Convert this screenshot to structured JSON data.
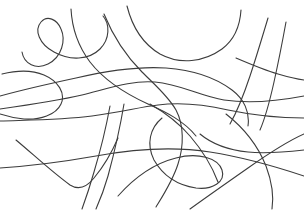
{
  "canvas": {
    "width": 304,
    "height": 210,
    "background_color": "#ffffff",
    "title": "Abstract curve scribble line drawing"
  },
  "style": {
    "stroke_color": "#3c3c3c",
    "stroke_width": 1.1,
    "fill": "none"
  },
  "chart_data": {
    "type": "line",
    "title": "",
    "xlabel": "",
    "ylabel": "",
    "xlim": [
      0,
      304
    ],
    "ylim": [
      0,
      210
    ],
    "grid": false,
    "legend": null,
    "note": "Twelve smooth freeform curves on a white field; dense crossing cluster near (150,105)",
    "series": [
      {
        "name": "curve-1-upper-left-leaf",
        "color": "#3c3c3c",
        "path": "M 22,52 C 24,64 36,70 48,64 C 62,57 66,40 61,29 C 57,19 47,15 41,22 C 34,30 39,44 54,52 C 70,61 89,60 100,49 C 110,39 110,24 103,16"
      },
      {
        "name": "curve-2-left-hook",
        "color": "#3c3c3c",
        "path": "M 2,74 C 14,71 30,69 44,75 C 58,81 66,93 61,104 C 56,115 40,120 24,119 C 14,118 6,116 0,114"
      },
      {
        "name": "curve-3-long-horizontal-upper",
        "color": "#3c3c3c",
        "path": "M 0,109 C 28,105 56,101 82,95 C 110,88 132,80 155,82 C 180,84 200,96 224,100 C 250,104 278,101 304,96"
      },
      {
        "name": "curve-4-horizontal-lower-twin",
        "color": "#3c3c3c",
        "path": "M 0,121 C 30,120 62,120 92,116 C 122,112 140,107 158,105 C 182,102 206,105 228,110 C 252,115 278,118 304,118"
      },
      {
        "name": "curve-5-top-descender-left",
        "color": "#3c3c3c",
        "path": "M 71,9 C 72,28 78,46 90,62 C 104,80 126,94 148,104 C 166,112 184,121 196,136"
      },
      {
        "name": "curve-6-top-arc-center",
        "color": "#3c3c3c",
        "path": "M 104,14 C 113,36 126,56 142,72 C 156,86 168,96 176,110 C 184,125 184,146 178,164 C 173,180 164,194 156,207"
      },
      {
        "name": "curve-7-top-long-sweep",
        "color": "#3c3c3c",
        "path": "M 127,6 C 132,26 143,44 160,54 C 180,65 204,62 222,49 C 234,40 240,26 241,10"
      },
      {
        "name": "curve-8-upper-plateau",
        "color": "#3c3c3c",
        "path": "M 0,96 C 22,90 48,84 76,78 C 106,71 136,66 166,68 C 194,70 216,78 232,90 C 244,99 250,112 248,126"
      },
      {
        "name": "curve-9-right-diagonal-a",
        "color": "#3c3c3c",
        "path": "M 268,18 C 262,38 256,58 250,76 C 244,94 238,110 230,124"
      },
      {
        "name": "curve-10-right-diagonal-b",
        "color": "#3c3c3c",
        "path": "M 286,22 C 282,44 278,64 274,82 C 270,100 266,116 260,130"
      },
      {
        "name": "curve-11-right-cross",
        "color": "#3c3c3c",
        "path": "M 236,58 C 250,64 264,70 278,74 C 288,77 296,79 304,80"
      },
      {
        "name": "curve-12-bottom-left-vee",
        "color": "#3c3c3c",
        "path": "M 16,140 C 34,155 52,172 70,185 C 78,190 86,188 94,178 C 104,166 112,152 118,138"
      },
      {
        "name": "curve-13-vertical-pair-left",
        "color": "#3c3c3c",
        "path": "M 110,106 C 106,128 100,152 94,172 C 90,186 86,198 82,209"
      },
      {
        "name": "curve-14-vertical-pair-right",
        "color": "#3c3c3c",
        "path": "M 124,104 C 120,128 114,154 108,176 C 104,190 100,200 96,209"
      },
      {
        "name": "curve-15-bottom-big-loop",
        "color": "#3c3c3c",
        "path": "M 118,196 C 134,178 152,164 176,158 C 198,152 218,158 222,170 C 226,182 212,190 196,188 C 176,185 162,174 154,160 C 146,144 150,128 162,118"
      },
      {
        "name": "curve-16-bottom-long-horizontal",
        "color": "#3c3c3c",
        "path": "M 0,168 C 30,166 62,162 96,156 C 134,149 172,146 210,152 C 248,158 280,168 304,176"
      },
      {
        "name": "curve-17-lower-right-diagonal",
        "color": "#3c3c3c",
        "path": "M 190,209 C 208,196 228,182 248,168 C 268,154 286,142 304,134"
      },
      {
        "name": "curve-18-lower-right-arc",
        "color": "#3c3c3c",
        "path": "M 226,114 C 244,128 258,146 266,166 C 272,182 274,196 272,209"
      },
      {
        "name": "curve-19-mid-connector",
        "color": "#3c3c3c",
        "path": "M 150,104 C 164,112 178,122 190,136 C 202,150 212,166 218,182"
      },
      {
        "name": "curve-20-right-tail",
        "color": "#3c3c3c",
        "path": "M 304,150 C 286,152 266,154 248,152 C 228,150 212,144 200,134"
      }
    ]
  }
}
